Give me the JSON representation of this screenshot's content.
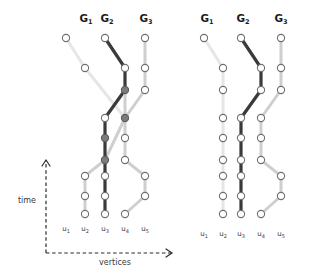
{
  "figure": {
    "title_hidden": "",
    "background": "#ffffff",
    "axes": {
      "time_label": "time",
      "vertices_label": "vertices"
    },
    "group_labels": [
      {
        "base": "G",
        "sub": "1"
      },
      {
        "base": "G",
        "sub": "2"
      },
      {
        "base": "G",
        "sub": "3"
      }
    ],
    "vertex_labels": [
      {
        "base": "u",
        "sub": "1"
      },
      {
        "base": "u",
        "sub": "2"
      },
      {
        "base": "u",
        "sub": "3"
      },
      {
        "base": "u",
        "sub": "4"
      },
      {
        "base": "u",
        "sub": "5"
      }
    ],
    "colors": {
      "dark": "#3a3a3a",
      "mid": "#8d8d8d",
      "light": "#cfcfcf",
      "faint": "#e6e6e6",
      "node_stroke": "#6f6f6f",
      "node_fill_open": "#ffffff",
      "node_fill_solid": "#7c7c7c",
      "text": "#1a1a1a",
      "axis": "#2b2b2b"
    },
    "panels": [
      {
        "name": "left-panel",
        "origin_x": 66,
        "group_label_x": [
          86,
          107,
          146
        ],
        "group_label_y": 22,
        "vertex_label_y": 231,
        "columns_x": [
          66,
          85,
          105,
          125,
          145
        ],
        "rows_y": [
          38,
          68,
          90,
          118,
          138,
          160,
          176,
          196,
          214
        ],
        "nodes": [
          {
            "col": 0,
            "row": 0,
            "fill": "open"
          },
          {
            "col": 1,
            "row": 1,
            "fill": "open"
          },
          {
            "col": 1,
            "row": 6,
            "fill": "open"
          },
          {
            "col": 1,
            "row": 7,
            "fill": "open"
          },
          {
            "col": 1,
            "row": 8,
            "fill": "open"
          },
          {
            "col": 2,
            "row": 0,
            "fill": "open"
          },
          {
            "col": 2,
            "row": 3,
            "fill": "open"
          },
          {
            "col": 2,
            "row": 4,
            "fill": "solid"
          },
          {
            "col": 2,
            "row": 5,
            "fill": "solid"
          },
          {
            "col": 2,
            "row": 6,
            "fill": "open"
          },
          {
            "col": 2,
            "row": 7,
            "fill": "open"
          },
          {
            "col": 2,
            "row": 8,
            "fill": "open"
          },
          {
            "col": 3,
            "row": 1,
            "fill": "open"
          },
          {
            "col": 3,
            "row": 2,
            "fill": "solid"
          },
          {
            "col": 3,
            "row": 3,
            "fill": "solid"
          },
          {
            "col": 3,
            "row": 4,
            "fill": "open"
          },
          {
            "col": 3,
            "row": 5,
            "fill": "open"
          },
          {
            "col": 3,
            "row": 8,
            "fill": "open"
          },
          {
            "col": 4,
            "row": 0,
            "fill": "open"
          },
          {
            "col": 4,
            "row": 1,
            "fill": "open"
          },
          {
            "col": 4,
            "row": 2,
            "fill": "open"
          },
          {
            "col": 4,
            "row": 6,
            "fill": "open"
          },
          {
            "col": 4,
            "row": 7,
            "fill": "open"
          }
        ],
        "edges": [
          {
            "from": [
              0,
              0
            ],
            "to": [
              1,
              1
            ],
            "shade": "faint"
          },
          {
            "from": [
              1,
              1
            ],
            "to": [
              3,
              3
            ],
            "shade": "faint"
          },
          {
            "from": [
              3,
              3
            ],
            "to": [
              2,
              5
            ],
            "shade": "light"
          },
          {
            "from": [
              2,
              5
            ],
            "to": [
              1,
              6
            ],
            "shade": "light"
          },
          {
            "from": [
              1,
              6
            ],
            "to": [
              1,
              7
            ],
            "shade": "light"
          },
          {
            "from": [
              1,
              7
            ],
            "to": [
              1,
              8
            ],
            "shade": "light"
          },
          {
            "from": [
              2,
              0
            ],
            "to": [
              3,
              1
            ],
            "shade": "dark"
          },
          {
            "from": [
              3,
              1
            ],
            "to": [
              3,
              2
            ],
            "shade": "dark"
          },
          {
            "from": [
              3,
              2
            ],
            "to": [
              2,
              3
            ],
            "shade": "dark"
          },
          {
            "from": [
              2,
              3
            ],
            "to": [
              2,
              4
            ],
            "shade": "dark"
          },
          {
            "from": [
              2,
              4
            ],
            "to": [
              2,
              5
            ],
            "shade": "dark"
          },
          {
            "from": [
              2,
              5
            ],
            "to": [
              2,
              6
            ],
            "shade": "dark"
          },
          {
            "from": [
              2,
              6
            ],
            "to": [
              2,
              7
            ],
            "shade": "dark"
          },
          {
            "from": [
              2,
              7
            ],
            "to": [
              2,
              8
            ],
            "shade": "dark"
          },
          {
            "from": [
              4,
              0
            ],
            "to": [
              4,
              1
            ],
            "shade": "light"
          },
          {
            "from": [
              4,
              1
            ],
            "to": [
              4,
              2
            ],
            "shade": "light"
          },
          {
            "from": [
              4,
              2
            ],
            "to": [
              3,
              3
            ],
            "shade": "light"
          },
          {
            "from": [
              3,
              2
            ],
            "to": [
              3,
              3
            ],
            "shade": "light"
          },
          {
            "from": [
              3,
              3
            ],
            "to": [
              3,
              4
            ],
            "shade": "light"
          },
          {
            "from": [
              3,
              4
            ],
            "to": [
              3,
              5
            ],
            "shade": "light"
          },
          {
            "from": [
              3,
              5
            ],
            "to": [
              4,
              6
            ],
            "shade": "light"
          },
          {
            "from": [
              4,
              6
            ],
            "to": [
              4,
              7
            ],
            "shade": "light"
          },
          {
            "from": [
              4,
              7
            ],
            "to": [
              3,
              8
            ],
            "shade": "light"
          }
        ]
      },
      {
        "name": "right-panel",
        "origin_x": 204,
        "group_label_x": [
          207,
          243,
          281
        ],
        "group_label_y": 22,
        "vertex_label_y": 236,
        "columns_x": [
          204,
          223,
          241,
          261,
          281
        ],
        "rows_y": [
          38,
          68,
          90,
          118,
          138,
          160,
          176,
          196,
          214
        ],
        "nodes": [
          {
            "col": 0,
            "row": 0,
            "fill": "open"
          },
          {
            "col": 1,
            "row": 1,
            "fill": "open"
          },
          {
            "col": 1,
            "row": 2,
            "fill": "open"
          },
          {
            "col": 1,
            "row": 3,
            "fill": "open"
          },
          {
            "col": 1,
            "row": 4,
            "fill": "open"
          },
          {
            "col": 1,
            "row": 5,
            "fill": "open"
          },
          {
            "col": 1,
            "row": 6,
            "fill": "open"
          },
          {
            "col": 1,
            "row": 7,
            "fill": "open"
          },
          {
            "col": 1,
            "row": 8,
            "fill": "open"
          },
          {
            "col": 2,
            "row": 0,
            "fill": "open"
          },
          {
            "col": 2,
            "row": 3,
            "fill": "open"
          },
          {
            "col": 2,
            "row": 4,
            "fill": "open"
          },
          {
            "col": 2,
            "row": 5,
            "fill": "open"
          },
          {
            "col": 2,
            "row": 6,
            "fill": "open"
          },
          {
            "col": 2,
            "row": 7,
            "fill": "open"
          },
          {
            "col": 2,
            "row": 8,
            "fill": "open"
          },
          {
            "col": 3,
            "row": 1,
            "fill": "open"
          },
          {
            "col": 3,
            "row": 2,
            "fill": "open"
          },
          {
            "col": 3,
            "row": 3,
            "fill": "open"
          },
          {
            "col": 3,
            "row": 4,
            "fill": "open"
          },
          {
            "col": 3,
            "row": 5,
            "fill": "open"
          },
          {
            "col": 3,
            "row": 8,
            "fill": "open"
          },
          {
            "col": 4,
            "row": 0,
            "fill": "open"
          },
          {
            "col": 4,
            "row": 1,
            "fill": "open"
          },
          {
            "col": 4,
            "row": 2,
            "fill": "open"
          },
          {
            "col": 4,
            "row": 6,
            "fill": "open"
          },
          {
            "col": 4,
            "row": 7,
            "fill": "open"
          }
        ],
        "edges": [
          {
            "from": [
              0,
              0
            ],
            "to": [
              1,
              1
            ],
            "shade": "faint"
          },
          {
            "from": [
              1,
              1
            ],
            "to": [
              1,
              2
            ],
            "shade": "faint"
          },
          {
            "from": [
              1,
              2
            ],
            "to": [
              1,
              3
            ],
            "shade": "faint"
          },
          {
            "from": [
              1,
              3
            ],
            "to": [
              1,
              4
            ],
            "shade": "faint"
          },
          {
            "from": [
              1,
              4
            ],
            "to": [
              1,
              5
            ],
            "shade": "faint"
          },
          {
            "from": [
              1,
              5
            ],
            "to": [
              1,
              6
            ],
            "shade": "faint"
          },
          {
            "from": [
              1,
              6
            ],
            "to": [
              1,
              7
            ],
            "shade": "faint"
          },
          {
            "from": [
              1,
              7
            ],
            "to": [
              1,
              8
            ],
            "shade": "faint"
          },
          {
            "from": [
              2,
              0
            ],
            "to": [
              3,
              1
            ],
            "shade": "dark"
          },
          {
            "from": [
              3,
              1
            ],
            "to": [
              3,
              2
            ],
            "shade": "dark"
          },
          {
            "from": [
              3,
              2
            ],
            "to": [
              2,
              3
            ],
            "shade": "dark"
          },
          {
            "from": [
              2,
              3
            ],
            "to": [
              2,
              4
            ],
            "shade": "dark"
          },
          {
            "from": [
              2,
              4
            ],
            "to": [
              2,
              5
            ],
            "shade": "dark"
          },
          {
            "from": [
              2,
              5
            ],
            "to": [
              2,
              6
            ],
            "shade": "dark"
          },
          {
            "from": [
              2,
              6
            ],
            "to": [
              2,
              7
            ],
            "shade": "dark"
          },
          {
            "from": [
              2,
              7
            ],
            "to": [
              2,
              8
            ],
            "shade": "dark"
          },
          {
            "from": [
              4,
              0
            ],
            "to": [
              4,
              1
            ],
            "shade": "light"
          },
          {
            "from": [
              4,
              1
            ],
            "to": [
              4,
              2
            ],
            "shade": "light"
          },
          {
            "from": [
              4,
              2
            ],
            "to": [
              3,
              3
            ],
            "shade": "light"
          },
          {
            "from": [
              3,
              3
            ],
            "to": [
              3,
              4
            ],
            "shade": "light"
          },
          {
            "from": [
              3,
              4
            ],
            "to": [
              3,
              5
            ],
            "shade": "light"
          },
          {
            "from": [
              3,
              5
            ],
            "to": [
              4,
              6
            ],
            "shade": "light"
          },
          {
            "from": [
              4,
              6
            ],
            "to": [
              4,
              7
            ],
            "shade": "light"
          },
          {
            "from": [
              4,
              7
            ],
            "to": [
              3,
              8
            ],
            "shade": "light"
          }
        ]
      }
    ],
    "axis_geometry": {
      "vertical_x": 46,
      "vertical_y_top": 160,
      "vertical_y_bottom": 253,
      "horizontal_y": 253,
      "horizontal_x_end": 172,
      "time_label_x": 27,
      "time_label_y": 203,
      "vertices_label_x": 115,
      "vertices_label_y": 265
    }
  }
}
